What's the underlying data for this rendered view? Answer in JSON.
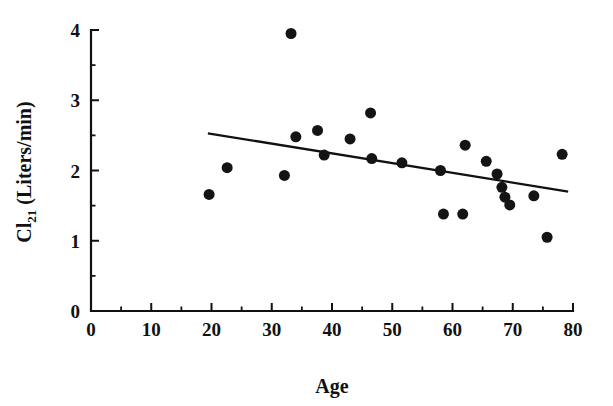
{
  "chart_data": {
    "type": "scatter",
    "title": "",
    "xlabel": "Age",
    "ylabel": "Cl21 (Liters/min)",
    "ylabel_base": "Cl",
    "ylabel_subscript": "21",
    "ylabel_unit": " (Liters/min)",
    "xlim": [
      0,
      80
    ],
    "ylim": [
      0,
      4
    ],
    "grid": false,
    "legend": "none",
    "x_major_ticks": [
      0,
      10,
      20,
      30,
      40,
      50,
      60,
      70,
      80
    ],
    "x_major_tick_labels": [
      "0",
      "10",
      "20",
      "30",
      "40",
      "50",
      "60",
      "70",
      "80"
    ],
    "x_minor_ticks": [
      5,
      15,
      25,
      35,
      45,
      55,
      65,
      75
    ],
    "y_major_ticks": [
      0,
      1,
      2,
      3,
      4
    ],
    "y_major_tick_labels": [
      "0",
      "1",
      "2",
      "3",
      "4"
    ],
    "y_minor_ticks": [
      0.5,
      1.5,
      2.5,
      3.5
    ],
    "marker": "filled-circle",
    "marker_color": "#141414",
    "marker_size_px": 11,
    "points": [
      {
        "x": 19.6,
        "y": 1.66
      },
      {
        "x": 22.6,
        "y": 2.04
      },
      {
        "x": 32.1,
        "y": 1.93
      },
      {
        "x": 33.2,
        "y": 3.95
      },
      {
        "x": 34.0,
        "y": 2.48
      },
      {
        "x": 37.6,
        "y": 2.57
      },
      {
        "x": 38.7,
        "y": 2.22
      },
      {
        "x": 43.0,
        "y": 2.45
      },
      {
        "x": 46.4,
        "y": 2.82
      },
      {
        "x": 46.6,
        "y": 2.17
      },
      {
        "x": 51.6,
        "y": 2.11
      },
      {
        "x": 58.0,
        "y": 2.0
      },
      {
        "x": 58.5,
        "y": 1.38
      },
      {
        "x": 61.7,
        "y": 1.38
      },
      {
        "x": 62.1,
        "y": 2.36
      },
      {
        "x": 65.6,
        "y": 2.13
      },
      {
        "x": 67.4,
        "y": 1.95
      },
      {
        "x": 68.2,
        "y": 1.76
      },
      {
        "x": 68.7,
        "y": 1.62
      },
      {
        "x": 69.5,
        "y": 1.51
      },
      {
        "x": 73.5,
        "y": 1.64
      },
      {
        "x": 75.7,
        "y": 1.05
      },
      {
        "x": 78.2,
        "y": 2.23
      }
    ],
    "fit_line": {
      "name": "regression-line",
      "x_start": 19.4,
      "y_start": 2.53,
      "x_end": 79.2,
      "y_end": 1.7,
      "color": "#111111"
    }
  }
}
